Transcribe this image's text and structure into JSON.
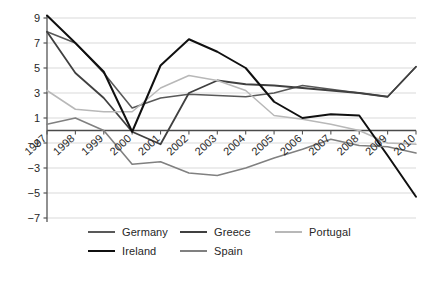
{
  "chart_data": {
    "type": "line",
    "title": "",
    "subtitle": "",
    "xlabel": "",
    "ylabel": "",
    "grid": true,
    "legend_position": "bottom",
    "x": [
      "1997",
      "1998",
      "1999",
      "2000",
      "2001",
      "2002",
      "2003",
      "2004",
      "2005",
      "2006",
      "2007",
      "2008",
      "2009",
      "2010"
    ],
    "categories": [
      "1997",
      "1998",
      "1999",
      "2000",
      "2001",
      "2002",
      "2003",
      "2004",
      "2005",
      "2006",
      "2007",
      "2008",
      "2009",
      "2010"
    ],
    "xlim": [
      "1997",
      "2010"
    ],
    "ylim": [
      -7,
      9
    ],
    "yticks": [
      "9",
      "7",
      "5",
      "3",
      "1",
      "-1",
      "-3",
      "-5",
      "-7"
    ],
    "ytick_values": [
      9,
      7,
      5,
      3,
      1,
      -1,
      -3,
      -5,
      -7
    ],
    "series": [
      {
        "name": "Germany",
        "color": "#595959",
        "width": 1.6,
        "values": [
          7.9,
          7.0,
          4.6,
          1.8,
          2.6,
          2.9,
          2.8,
          2.7,
          3.0,
          3.6,
          3.3,
          3.0,
          2.7,
          5.1
        ]
      },
      {
        "name": "Greece",
        "color": "#404040",
        "width": 1.8,
        "values": [
          7.9,
          4.6,
          2.6,
          -0.1,
          -1.1,
          3.0,
          4.0,
          3.7,
          3.6,
          3.4,
          3.2,
          3.0,
          2.7,
          5.1
        ]
      },
      {
        "name": "Portugal",
        "color": "#b8b8b8",
        "width": 1.5,
        "values": [
          3.2,
          1.7,
          1.5,
          1.5,
          3.4,
          4.4,
          4.0,
          3.2,
          1.2,
          0.9,
          0.5,
          0.0,
          -1.0,
          -1.1
        ]
      },
      {
        "name": "Ireland",
        "color": "#101010",
        "width": 2.0,
        "values": [
          9.2,
          7.0,
          4.7,
          -0.1,
          5.2,
          7.3,
          6.3,
          5.0,
          2.3,
          1.0,
          1.3,
          1.2,
          -2.0,
          -5.3
        ]
      },
      {
        "name": "Spain",
        "color": "#808080",
        "width": 1.6,
        "values": [
          0.5,
          1.0,
          0.0,
          -2.7,
          -2.5,
          -3.4,
          -3.6,
          -3.0,
          -2.2,
          -1.5,
          -0.7,
          -1.2,
          -1.3,
          -1.8
        ]
      }
    ],
    "legend": [
      {
        "label": "Germany",
        "color": "#595959"
      },
      {
        "label": "Greece",
        "color": "#404040"
      },
      {
        "label": "Portugal",
        "color": "#b8b8b8"
      },
      {
        "label": "Ireland",
        "color": "#101010"
      },
      {
        "label": "Spain",
        "color": "#808080"
      }
    ],
    "axis_color": "#555555",
    "grid_color": "#d9d9d9",
    "zero_line_color": "#4a4a4a",
    "tick_label_color": "#272727"
  }
}
